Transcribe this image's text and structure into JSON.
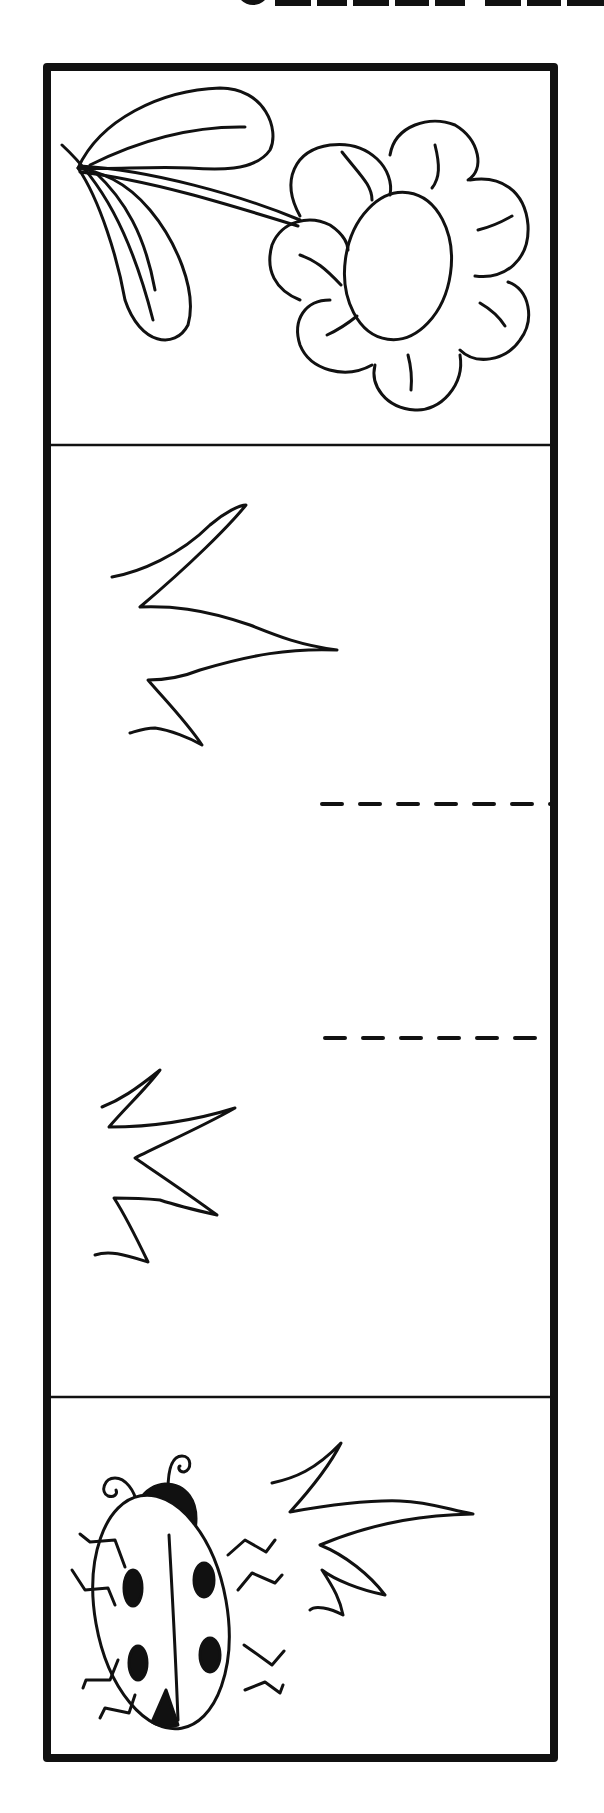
{
  "page": {
    "type": "tracing-worksheet",
    "heading_visible_text": "",
    "heading_note": "heading cropped at top edge; only bottom slivers of bold letters visible",
    "colors": {
      "ink": "#111111",
      "paper": "#ffffff"
    }
  },
  "panels": [
    {
      "id": "top",
      "subject": "flower",
      "elements": [
        "flower-head",
        "8-petals",
        "stem",
        "two-leaves"
      ]
    },
    {
      "id": "middle",
      "subject": "grass-tracing-area",
      "elements": [
        "grass-tuft-upper",
        "grass-tuft-lower",
        "dashed-guide-line-1",
        "dashed-guide-line-2"
      ]
    },
    {
      "id": "bottom",
      "subject": "ladybug",
      "elements": [
        "ladybug",
        "grass-tuft"
      ]
    }
  ],
  "guides": [
    {
      "name": "dashed-line-1",
      "y": 804,
      "x_start": 322,
      "x_end": 551
    },
    {
      "name": "dashed-line-2",
      "y": 1038,
      "x_start": 325,
      "x_end": 551
    }
  ]
}
